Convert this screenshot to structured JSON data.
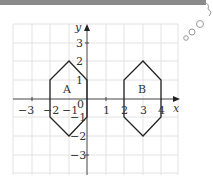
{
  "header": {
    "bar_color": "#8a8a8a"
  },
  "diagram": {
    "axis_labels": {
      "x": "x",
      "y": "y"
    },
    "x_ticks": [
      {
        "value": -3,
        "label": "−3"
      },
      {
        "value": -2,
        "label": "−2"
      },
      {
        "value": -1,
        "label": "−1"
      },
      {
        "value": 1,
        "label": "1"
      },
      {
        "value": 2,
        "label": "2"
      },
      {
        "value": 3,
        "label": "3"
      },
      {
        "value": 4,
        "label": "4"
      }
    ],
    "y_ticks": [
      {
        "value": 3,
        "label": "3"
      },
      {
        "value": 2,
        "label": "2"
      },
      {
        "value": 1,
        "label": "1"
      },
      {
        "value": -1,
        "label": "−1"
      },
      {
        "value": -2,
        "label": "−2"
      },
      {
        "value": -3,
        "label": "−3"
      }
    ],
    "origin_label": "0",
    "shapes": [
      {
        "name": "A",
        "label": "A",
        "vertices": [
          [
            -1,
            2
          ],
          [
            0,
            1
          ],
          [
            0,
            -1
          ],
          [
            -1,
            -2
          ],
          [
            -2,
            -1
          ],
          [
            -2,
            1
          ]
        ]
      },
      {
        "name": "B",
        "label": "B",
        "vertices": [
          [
            3,
            2
          ],
          [
            4,
            1
          ],
          [
            4,
            -1
          ],
          [
            3,
            -2
          ],
          [
            2,
            -1
          ],
          [
            2,
            1
          ]
        ]
      }
    ],
    "grid": {
      "x_range": [
        -4,
        5
      ],
      "y_range": [
        -4,
        4
      ]
    }
  }
}
